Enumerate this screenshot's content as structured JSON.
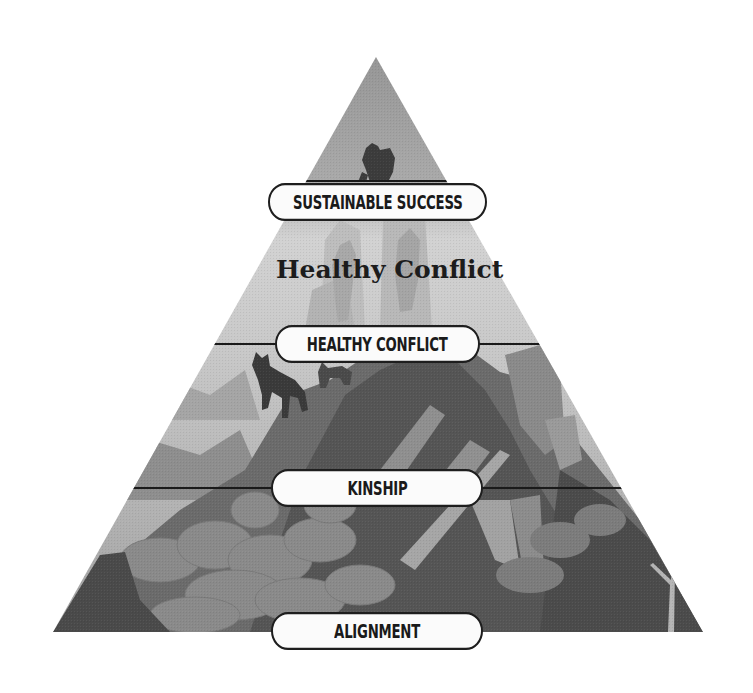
{
  "diagram": {
    "type": "pyramid",
    "heading": "Healthy Conflict",
    "levels": [
      {
        "label": "SUSTAINABLE SUCCESS",
        "position": "top"
      },
      {
        "label": "HEALTHY CONFLICT",
        "position": "upper-middle"
      },
      {
        "label": "KINSHIP",
        "position": "lower-middle"
      },
      {
        "label": "ALIGNMENT",
        "position": "base"
      }
    ],
    "illustration": {
      "description": "Grayscale mountain scene with a climber at the peak, wolves on the slopes, clouds and a bare tree in the lower band",
      "colors": {
        "sky_top": "#9a9a9a",
        "sky_mid": "#d4d4d4",
        "mountain_dark": "#4a4a4a",
        "mountain_mid": "#6e6e6e",
        "mountain_light": "#9c9c9c",
        "cloud": "#8a8a8a",
        "figure": "#3c3c3c",
        "divider": "#1a1a1a"
      }
    }
  }
}
